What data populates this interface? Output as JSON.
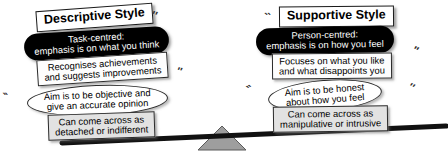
{
  "diagram": {
    "colors": {
      "pill_fill": "#000000",
      "pill_text": "#ffffff",
      "box_fill": "#fdfdfd",
      "shaded_box_fill": "#e2e2e2",
      "outline": "#2b2b2b",
      "beam": "#111111",
      "fulcrum": "#9a9a9a"
    },
    "left": {
      "title": "Descriptive Style",
      "pill": {
        "line1": "Task-centred:",
        "line2": "emphasis is on what you think"
      },
      "box1": {
        "line1": "Recognises achievements",
        "line2": "and suggests improvements"
      },
      "oval": {
        "line1": "Aim is to be objective and",
        "line2": "give an accurate opinion"
      },
      "box2": {
        "line1": "Can come across as",
        "line2": "detached or indifferent"
      }
    },
    "right": {
      "title": "Supportive Style",
      "pill": {
        "line1": "Person-centred:",
        "line2": "emphasis is on how you feel"
      },
      "box1": {
        "line1": "Focuses on what you like",
        "line2": "and what disappoints you"
      },
      "oval": {
        "line1": "Aim is to be honest",
        "line2": "about how you feel"
      },
      "box2": {
        "line1": "Can come across as",
        "line2": "manipulative or intrusive"
      }
    },
    "decor": {
      "tick_pair": "′′",
      "tick_pair_alt": "‵‵"
    }
  }
}
